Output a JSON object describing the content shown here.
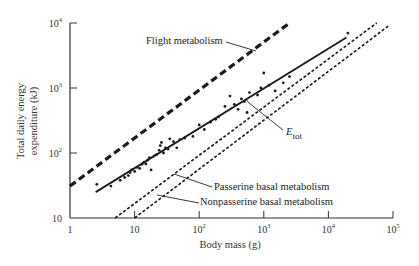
{
  "chart_data": {
    "type": "line",
    "title": "",
    "xlabel": "Body mass (g)",
    "ylabel_line1": "Total daily energy",
    "ylabel_line2": "expenditure (kJ)",
    "xscale": "log",
    "yscale": "log",
    "xlim": [
      1,
      100000
    ],
    "ylim": [
      10,
      10000
    ],
    "grid": false,
    "legend_position": "inline annotations",
    "x_ticks": [
      {
        "value": 1,
        "label": "1",
        "sup": ""
      },
      {
        "value": 10,
        "label": "10",
        "sup": ""
      },
      {
        "value": 100,
        "label": "10",
        "sup": "2"
      },
      {
        "value": 1000,
        "label": "10",
        "sup": "3"
      },
      {
        "value": 10000,
        "label": "10",
        "sup": "4"
      },
      {
        "value": 100000,
        "label": "10",
        "sup": "5"
      }
    ],
    "y_ticks": [
      {
        "value": 10,
        "label": "10",
        "sup": ""
      },
      {
        "value": 100,
        "label": "10",
        "sup": "2"
      },
      {
        "value": 1000,
        "label": "10",
        "sup": "3"
      },
      {
        "value": 10000,
        "label": "10",
        "sup": "4"
      }
    ],
    "series": [
      {
        "name": "Flight metabolism",
        "style": "heavy-dashed",
        "x": [
          1,
          2500
        ],
        "y": [
          31,
          10000
        ]
      },
      {
        "name": "E_tot",
        "style": "solid",
        "x": [
          2.5,
          19000
        ],
        "y": [
          25,
          6000
        ]
      },
      {
        "name": "Passerine basal metabolism",
        "style": "dashed",
        "x": [
          5,
          56000
        ],
        "y": [
          10,
          10000
        ]
      },
      {
        "name": "Nonpasserine basal metabolism",
        "style": "dashed",
        "x": [
          10,
          85000
        ],
        "y": [
          10,
          9000
        ]
      }
    ],
    "scatter_points": [
      [
        2.6,
        33
      ],
      [
        4.3,
        31
      ],
      [
        6,
        38
      ],
      [
        7,
        42
      ],
      [
        8,
        45
      ],
      [
        8.5,
        50
      ],
      [
        9,
        55
      ],
      [
        10,
        52
      ],
      [
        11,
        60
      ],
      [
        12,
        58
      ],
      [
        13,
        67
      ],
      [
        14,
        72
      ],
      [
        15,
        68
      ],
      [
        16,
        78
      ],
      [
        17,
        85
      ],
      [
        18,
        55
      ],
      [
        20,
        90
      ],
      [
        22,
        95
      ],
      [
        24,
        110
      ],
      [
        25,
        130
      ],
      [
        26,
        145
      ],
      [
        28,
        100
      ],
      [
        30,
        120
      ],
      [
        33,
        115
      ],
      [
        35,
        165
      ],
      [
        40,
        150
      ],
      [
        45,
        120
      ],
      [
        50,
        160
      ],
      [
        60,
        170
      ],
      [
        80,
        180
      ],
      [
        100,
        270
      ],
      [
        120,
        230
      ],
      [
        150,
        300
      ],
      [
        180,
        330
      ],
      [
        200,
        360
      ],
      [
        250,
        520
      ],
      [
        300,
        750
      ],
      [
        350,
        560
      ],
      [
        400,
        470
      ],
      [
        450,
        680
      ],
      [
        500,
        620
      ],
      [
        550,
        420
      ],
      [
        600,
        850
      ],
      [
        800,
        780
      ],
      [
        900,
        1000
      ],
      [
        1000,
        1700
      ],
      [
        1200,
        1100
      ],
      [
        1500,
        900
      ],
      [
        2000,
        1200
      ],
      [
        2500,
        1500
      ],
      [
        20000,
        7000
      ]
    ],
    "annotations": [
      {
        "text": "Flight metabolism",
        "points_to_series": "Flight metabolism"
      },
      {
        "text": "E",
        "subscript": "tot",
        "points_to_series": "E_tot"
      },
      {
        "text": "Passerine basal metabolism",
        "points_to_series": "Passerine basal metabolism"
      },
      {
        "text": "Nonpasserine basal metabolism",
        "points_to_series": "Nonpasserine basal metabolism"
      }
    ]
  },
  "labels": {
    "flight": "Flight metabolism",
    "etot_main": "E",
    "etot_sub": "tot",
    "passerine": "Passerine basal metabolism",
    "nonpasserine": "Nonpasserine basal metabolism",
    "xlabel": "Body mass (g)",
    "ylabel_line1": "Total daily energy",
    "ylabel_line2": "expenditure (kJ)"
  },
  "colors": {
    "ink": "#1a1a1a",
    "axis": "#333333",
    "background": "#ffffff"
  }
}
